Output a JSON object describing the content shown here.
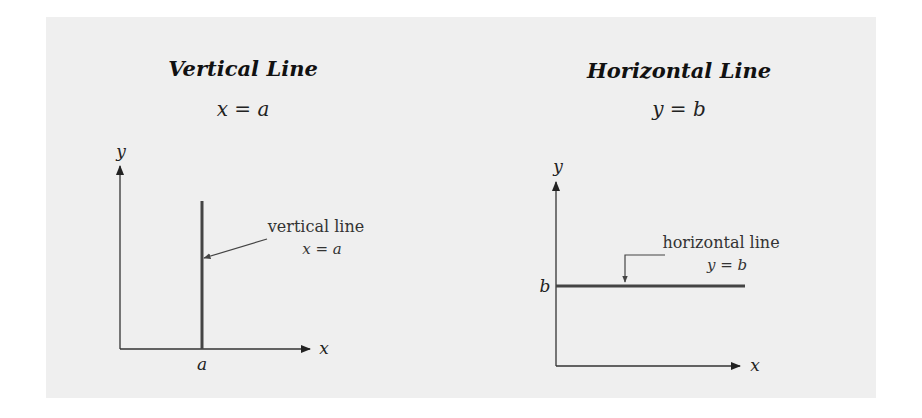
{
  "left_panel": {
    "title": "Vertical Line",
    "equation": "x = a",
    "y_axis_label": "y",
    "x_axis_label": "x",
    "tick_label": "a",
    "callout_text": "vertical line",
    "callout_equation": "x = a"
  },
  "right_panel": {
    "title": "Horizontal Line",
    "equation": "y = b",
    "y_axis_label": "y",
    "x_axis_label": "x",
    "tick_label": "b",
    "callout_text": "horizontal line",
    "callout_equation": "y = b"
  },
  "colors": {
    "background": "#efefef",
    "line": "#444444",
    "axis": "#333333"
  }
}
